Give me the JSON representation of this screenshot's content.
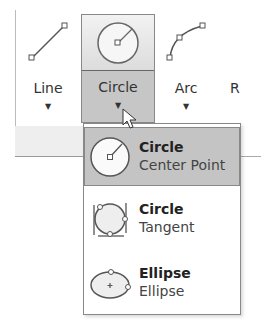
{
  "ribbon": {
    "tools": [
      {
        "label": "Line",
        "icon": "line-icon",
        "has_dropdown": true
      },
      {
        "label": "Circle",
        "icon": "circle-center-icon",
        "has_dropdown": true,
        "state": "pressed"
      },
      {
        "label": "Arc",
        "icon": "arc-icon",
        "has_dropdown": true
      },
      {
        "label": "R"
      }
    ]
  },
  "dropdown": {
    "items": [
      {
        "title": "Circle",
        "subtitle": "Center Point",
        "icon": "circle-center-point-icon",
        "highlighted": true
      },
      {
        "title": "Circle",
        "subtitle": "Tangent",
        "icon": "circle-tangent-icon"
      },
      {
        "title": "Ellipse",
        "subtitle": "Ellipse",
        "icon": "ellipse-icon"
      }
    ]
  },
  "colors": {
    "highlight": "#c4c4c4",
    "border": "#888888"
  }
}
